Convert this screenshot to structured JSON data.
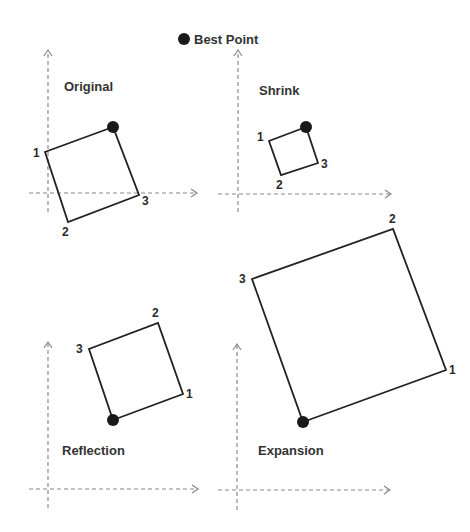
{
  "legend": {
    "marker": "filled-circle",
    "label": "Best Point"
  },
  "colors": {
    "simplex": "#222222",
    "axis": "#8a8a8a",
    "best": "#1a1a1a",
    "text": "#333333"
  },
  "panels": [
    {
      "id": "original",
      "title": "Original",
      "title_pos": [
        64,
        91
      ],
      "axes": {
        "origin": [
          48,
          193
        ],
        "x_from": 29,
        "x_to": 197,
        "y_from": 50,
        "y_to": 212
      },
      "vertices": [
        {
          "label": "1",
          "pt": [
            45,
            152
          ],
          "label_pos": [
            33,
            157
          ]
        },
        {
          "label": "2",
          "pt": [
            68,
            222
          ],
          "label_pos": [
            62,
            236
          ]
        },
        {
          "label": "3",
          "pt": [
            139,
            195
          ],
          "label_pos": [
            142,
            205
          ]
        }
      ],
      "best": [
        113,
        127
      ]
    },
    {
      "id": "shrink",
      "title": "Shrink",
      "title_pos": [
        259,
        95
      ],
      "axes": {
        "origin": [
          238,
          194
        ],
        "x_from": 218,
        "x_to": 391,
        "y_from": 50,
        "y_to": 212
      },
      "vertices": [
        {
          "label": "1",
          "pt": [
            269,
            141
          ],
          "label_pos": [
            257,
            141
          ]
        },
        {
          "label": "2",
          "pt": [
            281,
            175
          ],
          "label_pos": [
            276,
            189
          ]
        },
        {
          "label": "3",
          "pt": [
            318,
            163
          ],
          "label_pos": [
            321,
            168
          ]
        }
      ],
      "best": [
        306,
        127
      ]
    },
    {
      "id": "reflection",
      "title": "Reflection",
      "title_pos": [
        62,
        455
      ],
      "axes": {
        "origin": [
          48,
          489
        ],
        "x_from": 29,
        "x_to": 198,
        "y_from": 342,
        "y_to": 508
      },
      "vertices": [
        {
          "label": "1",
          "pt": [
            183,
            394
          ],
          "label_pos": [
            186,
            398
          ]
        },
        {
          "label": "2",
          "pt": [
            158,
            323
          ],
          "label_pos": [
            152,
            317
          ]
        },
        {
          "label": "3",
          "pt": [
            89,
            349
          ],
          "label_pos": [
            76,
            353
          ]
        }
      ],
      "best": [
        113,
        420
      ]
    },
    {
      "id": "expansion",
      "title": "Expansion",
      "title_pos": [
        258,
        455
      ],
      "axes": {
        "origin": [
          237,
          490
        ],
        "x_from": 218,
        "x_to": 390,
        "y_from": 344,
        "y_to": 510
      },
      "vertices": [
        {
          "label": "1",
          "pt": [
            446,
            370
          ],
          "label_pos": [
            449,
            374
          ]
        },
        {
          "label": "2",
          "pt": [
            393,
            229
          ],
          "label_pos": [
            389,
            223
          ]
        },
        {
          "label": "3",
          "pt": [
            252,
            279
          ],
          "label_pos": [
            239,
            283
          ]
        }
      ],
      "best": [
        303,
        422
      ]
    }
  ]
}
